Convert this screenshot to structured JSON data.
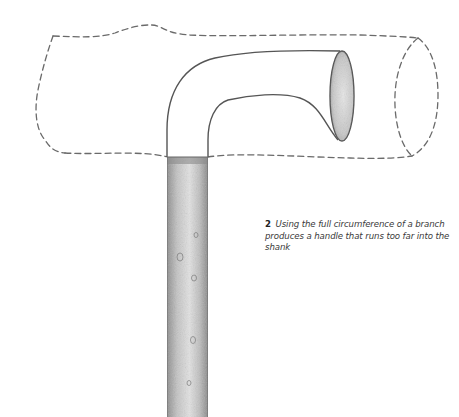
{
  "figure": {
    "number": "2",
    "caption": "Using the full circumference of a branch produces a handle that runs too far into the shank",
    "elements": {
      "branch_outline": "dashed-branch-outline",
      "handle": "curved-handle",
      "handle_end_face": "cut-end-ellipse",
      "shank": "textured-shank"
    },
    "colors": {
      "background": "#ffffff",
      "outline": "#555555",
      "dash": "#6a6a6a",
      "shank_shade": "#9a9a9a",
      "caption_text": "#3a3a3a"
    }
  }
}
